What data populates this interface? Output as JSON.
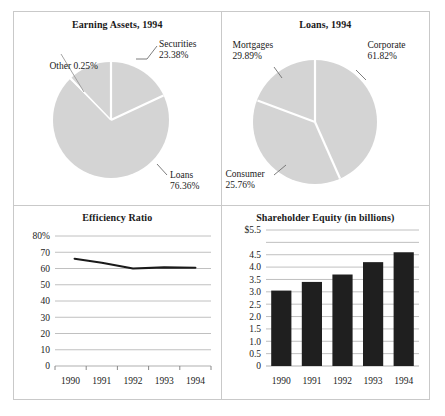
{
  "chart_data": [
    {
      "type": "pie",
      "title": "Earning Assets, 1994",
      "categories": [
        "Securities",
        "Loans",
        "Other"
      ],
      "values": [
        23.38,
        76.36,
        0.25
      ],
      "labels": [
        {
          "name": "Securities",
          "pct": "23.38%"
        },
        {
          "name": "Loans",
          "pct": "76.36%"
        },
        {
          "name": "Other",
          "pct": "0.25%"
        }
      ],
      "other_inline_label": "Other 0.25%",
      "slice_color": "#d4d4d4",
      "divider_color": "#ffffff",
      "legend": "none"
    },
    {
      "type": "pie",
      "title": "Loans, 1994",
      "categories": [
        "Corporate",
        "Mortgages",
        "Consumer"
      ],
      "values": [
        61.82,
        29.89,
        25.76
      ],
      "labels": [
        {
          "name": "Corporate",
          "pct": "61.82%"
        },
        {
          "name": "Mortgages",
          "pct": "29.89%"
        },
        {
          "name": "Consumer",
          "pct": "25.76%"
        }
      ],
      "slice_color": "#d4d4d4",
      "divider_color": "#ffffff",
      "legend": "none"
    },
    {
      "type": "line",
      "title": "Efficiency Ratio",
      "categories": [
        "1990",
        "1991",
        "1992",
        "1993",
        "1994"
      ],
      "values": [
        66,
        63.5,
        60,
        60.7,
        60.5
      ],
      "xlabel": "",
      "ylabel": "",
      "ylim": [
        0,
        80
      ],
      "yticks": [
        "80%",
        "70",
        "60",
        "50",
        "40",
        "30",
        "20",
        "10",
        "0"
      ],
      "ytick_values": [
        80,
        70,
        60,
        50,
        40,
        30,
        20,
        10,
        0
      ],
      "grid": true,
      "line_color": "#1a1a1a"
    },
    {
      "type": "bar",
      "title": "Shareholder Equity (in billions)",
      "categories": [
        "1990",
        "1991",
        "1992",
        "1993",
        "1994"
      ],
      "values": [
        3.05,
        3.4,
        3.7,
        4.2,
        4.6
      ],
      "xlabel": "",
      "ylabel": "",
      "ylim": [
        0,
        5.5
      ],
      "yticks": [
        "$5.5",
        "",
        "4.5",
        "4.0",
        "3.5",
        "3.0",
        "2.5",
        "2.0",
        "1.5",
        "1.0",
        "0.5",
        "0"
      ],
      "ytick_values": [
        5.5,
        5.0,
        4.5,
        4.0,
        3.5,
        3.0,
        2.5,
        2.0,
        1.5,
        1.0,
        0.5,
        0
      ],
      "grid": true,
      "bar_color": "#1f1f1f"
    }
  ]
}
